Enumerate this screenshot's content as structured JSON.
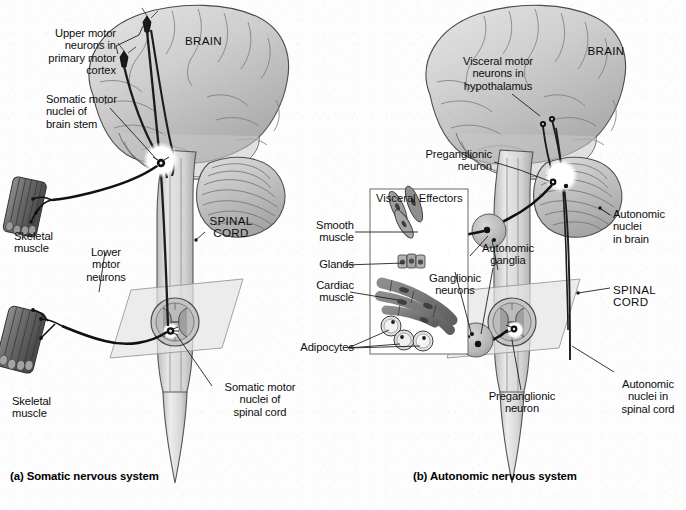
{
  "figure": {
    "background_color": "#fdfdfd",
    "ink_color": "#101010",
    "brain_fill": "#cfcfcf",
    "cord_fill": "#d8d8d8",
    "ganglion_fill": "#bdbdbd",
    "plane_fill": "#e2e2e2"
  },
  "panel_a": {
    "caption": "(a) Somatic nervous system",
    "organ_labels": {
      "brain": "BRAIN",
      "spinal_cord": "SPINAL\nCORD"
    },
    "labels": [
      {
        "id": "upper-motor-neurons",
        "text": "Upper motor\nneurons in\nprimary motor\ncortex"
      },
      {
        "id": "somatic-motor-nuclei-brain",
        "text": "Somatic motor\nnuclei of\nbrain stem"
      },
      {
        "id": "skeletal-muscle-upper",
        "text": "Skeletal\nmuscle"
      },
      {
        "id": "lower-motor-neurons",
        "text": "Lower\nmotor\nneurons"
      },
      {
        "id": "skeletal-muscle-lower",
        "text": "Skeletal\nmuscle"
      },
      {
        "id": "somatic-motor-nuclei-cord",
        "text": "Somatic motor\nnuclei of\nspinal cord"
      }
    ]
  },
  "panel_b": {
    "caption": "(b) Autonomic nervous system",
    "organ_labels": {
      "brain": "BRAIN",
      "spinal_cord": "SPINAL\nCORD"
    },
    "labels": [
      {
        "id": "visceral-motor-neurons",
        "text": "Visceral motor\nneurons in\nhypothalamus"
      },
      {
        "id": "preganglionic-neuron-upper",
        "text": "Preganglionic\nneuron"
      },
      {
        "id": "autonomic-nuclei-brain",
        "text": "Autonomic\nnuclei\nin brain"
      },
      {
        "id": "autonomic-ganglia",
        "text": "Autonomic\nganglia"
      },
      {
        "id": "ganglionic-neurons",
        "text": "Ganglionic\nneurons"
      },
      {
        "id": "preganglionic-neuron-lower",
        "text": "Preganglionic\nneuron"
      },
      {
        "id": "autonomic-nuclei-cord",
        "text": "Autonomic\nnuclei in\nspinal cord"
      }
    ],
    "visceral_effectors": {
      "title": "Visceral Effectors",
      "items": [
        {
          "id": "smooth-muscle",
          "text": "Smooth\nmuscle"
        },
        {
          "id": "glands",
          "text": "Glands"
        },
        {
          "id": "cardiac-muscle",
          "text": "Cardiac\nmuscle"
        },
        {
          "id": "adipocytes",
          "text": "Adipocytes"
        }
      ]
    }
  }
}
